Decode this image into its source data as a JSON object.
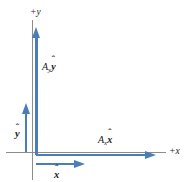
{
  "figure": {
    "background_color": "#ffffff",
    "axis_color": "#8c8c8c",
    "vector_color": "#4a7ebb",
    "text_color": "#1a1a1a"
  },
  "axes": {
    "y_axis_label": "+y",
    "x_axis_label": "+x",
    "origin_x": 36,
    "origin_y": 152
  },
  "vectors": [
    {
      "id": "ay-component",
      "label_prefix": "A",
      "label_subscript": "y",
      "label_unit": "y",
      "label_hat": "ˆ",
      "direction": "up",
      "label_text": "A",
      "length_px": 120
    },
    {
      "id": "ax-component",
      "label_prefix": "A",
      "label_subscript": "x",
      "label_unit": "x",
      "label_hat": "ˆ",
      "direction": "right",
      "label_text": "A",
      "length_px": 112
    }
  ],
  "unit_vectors": [
    {
      "id": "y-hat",
      "symbol": "y",
      "hat": "ˆ",
      "direction": "up",
      "length_px": 48
    },
    {
      "id": "x-hat",
      "symbol": "x",
      "hat": "ˆ",
      "direction": "right",
      "length_px": 48
    }
  ]
}
